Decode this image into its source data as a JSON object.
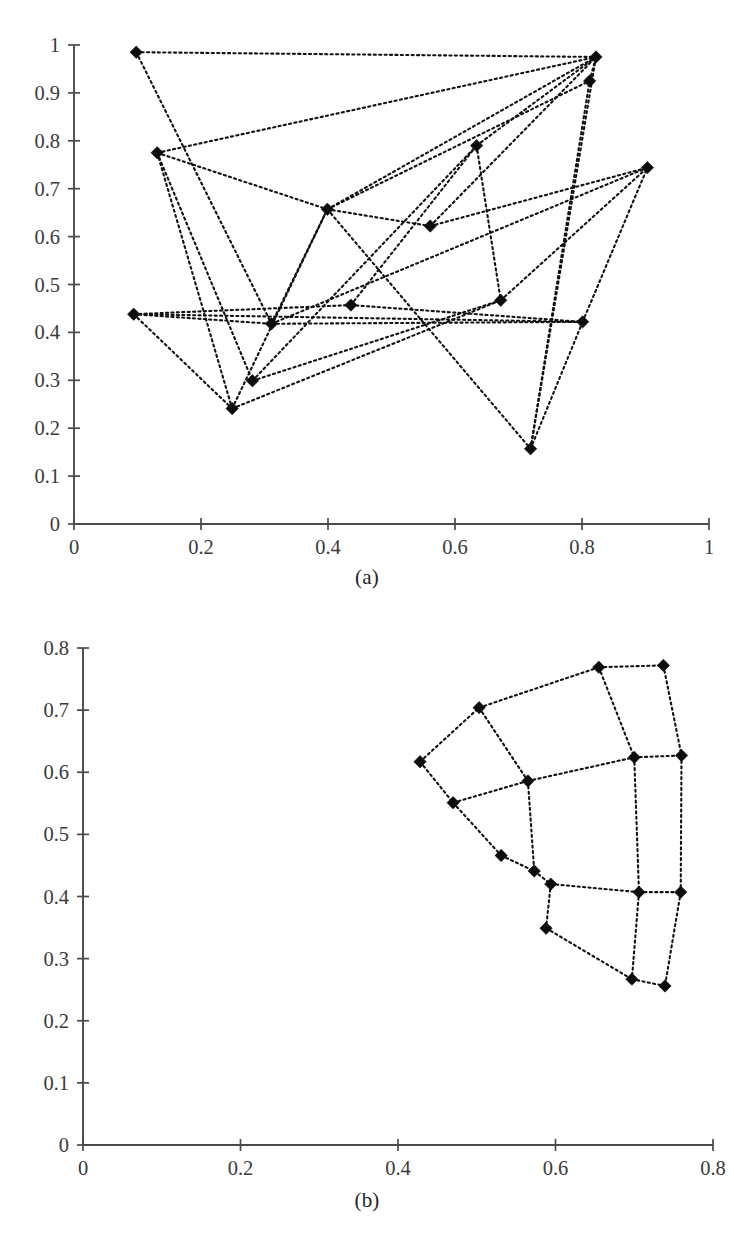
{
  "figure": {
    "panels": [
      {
        "caption": "(a)"
      },
      {
        "caption": "(b)"
      }
    ]
  },
  "chart_data": [
    {
      "type": "scatter",
      "panel": "(a)",
      "title": "",
      "subtitle": "",
      "xlabel": "",
      "ylabel": "",
      "xlim": [
        0,
        1
      ],
      "ylim": [
        0,
        1
      ],
      "xticks": [
        0,
        0.2,
        0.4,
        0.6,
        0.8,
        1
      ],
      "yticks": [
        0,
        0.1,
        0.2,
        0.3,
        0.4,
        0.5,
        0.6,
        0.7,
        0.8,
        0.9,
        1
      ],
      "xticklabels": [
        "0",
        "0.2",
        "0.4",
        "0.6",
        "0.8",
        "1"
      ],
      "yticklabels": [
        "0",
        "0.1",
        "0.2",
        "0.3",
        "0.4",
        "0.5",
        "0.6",
        "0.7",
        "0.8",
        "0.9",
        "1"
      ],
      "grid": false,
      "legend": null,
      "marker": "filled-diamond",
      "linestyle": "dotted",
      "color": "#0d0d0d",
      "description": "Randomly initialized graph layout: 16 nodes connected by dotted edges, heavily crossing.",
      "nodes": [
        {
          "id": 0,
          "x": 0.098,
          "y": 0.985
        },
        {
          "id": 1,
          "x": 0.131,
          "y": 0.775
        },
        {
          "id": 2,
          "x": 0.094,
          "y": 0.438
        },
        {
          "id": 3,
          "x": 0.249,
          "y": 0.241
        },
        {
          "id": 4,
          "x": 0.281,
          "y": 0.299
        },
        {
          "id": 5,
          "x": 0.311,
          "y": 0.418
        },
        {
          "id": 6,
          "x": 0.399,
          "y": 0.657
        },
        {
          "id": 7,
          "x": 0.436,
          "y": 0.457
        },
        {
          "id": 8,
          "x": 0.561,
          "y": 0.622
        },
        {
          "id": 9,
          "x": 0.634,
          "y": 0.79
        },
        {
          "id": 10,
          "x": 0.672,
          "y": 0.467
        },
        {
          "id": 11,
          "x": 0.719,
          "y": 0.157
        },
        {
          "id": 12,
          "x": 0.801,
          "y": 0.422
        },
        {
          "id": 13,
          "x": 0.812,
          "y": 0.925
        },
        {
          "id": 14,
          "x": 0.822,
          "y": 0.975
        },
        {
          "id": 15,
          "x": 0.903,
          "y": 0.744
        }
      ],
      "edges": [
        [
          0,
          5
        ],
        [
          0,
          14
        ],
        [
          1,
          14
        ],
        [
          1,
          4
        ],
        [
          1,
          3
        ],
        [
          1,
          6
        ],
        [
          2,
          5
        ],
        [
          2,
          12
        ],
        [
          2,
          3
        ],
        [
          2,
          7
        ],
        [
          3,
          10
        ],
        [
          3,
          6
        ],
        [
          4,
          10
        ],
        [
          4,
          9
        ],
        [
          5,
          6
        ],
        [
          5,
          15
        ],
        [
          5,
          12
        ],
        [
          6,
          14
        ],
        [
          6,
          13
        ],
        [
          6,
          11
        ],
        [
          6,
          8
        ],
        [
          7,
          12
        ],
        [
          7,
          9
        ],
        [
          8,
          14
        ],
        [
          8,
          15
        ],
        [
          9,
          14
        ],
        [
          9,
          10
        ],
        [
          10,
          15
        ],
        [
          11,
          13
        ],
        [
          11,
          14
        ],
        [
          11,
          12
        ],
        [
          12,
          15
        ],
        [
          13,
          14
        ]
      ]
    },
    {
      "type": "scatter",
      "panel": "(b)",
      "title": "",
      "subtitle": "",
      "xlabel": "",
      "ylabel": "",
      "xlim": [
        0,
        0.8
      ],
      "ylim": [
        0,
        0.8
      ],
      "xticks": [
        0,
        0.2,
        0.4,
        0.6,
        0.8
      ],
      "yticks": [
        0,
        0.1,
        0.2,
        0.3,
        0.4,
        0.5,
        0.6,
        0.7,
        0.8
      ],
      "xticklabels": [
        "0",
        "0.2",
        "0.4",
        "0.6",
        "0.8"
      ],
      "yticklabels": [
        "0",
        "0.1",
        "0.2",
        "0.3",
        "0.4",
        "0.5",
        "0.6",
        "0.7",
        "0.8"
      ],
      "grid": false,
      "legend": null,
      "marker": "filled-diamond",
      "linestyle": "dotted",
      "color": "#0d0d0d",
      "description": "Converged / untangled layout of the same 16-node graph, forming a regular 4x4 quadrilateral mesh in the upper-right region.",
      "nodes": [
        {
          "id": 0,
          "x": 0.428,
          "y": 0.617
        },
        {
          "id": 1,
          "x": 0.503,
          "y": 0.704
        },
        {
          "id": 2,
          "x": 0.655,
          "y": 0.769
        },
        {
          "id": 3,
          "x": 0.737,
          "y": 0.772
        },
        {
          "id": 4,
          "x": 0.47,
          "y": 0.551
        },
        {
          "id": 5,
          "x": 0.565,
          "y": 0.586
        },
        {
          "id": 6,
          "x": 0.7,
          "y": 0.624
        },
        {
          "id": 7,
          "x": 0.76,
          "y": 0.627
        },
        {
          "id": 8,
          "x": 0.531,
          "y": 0.466
        },
        {
          "id": 9,
          "x": 0.573,
          "y": 0.441
        },
        {
          "id": 10,
          "x": 0.594,
          "y": 0.42
        },
        {
          "id": 11,
          "x": 0.706,
          "y": 0.407
        },
        {
          "id": 12,
          "x": 0.759,
          "y": 0.407
        },
        {
          "id": 13,
          "x": 0.588,
          "y": 0.349
        },
        {
          "id": 14,
          "x": 0.697,
          "y": 0.267
        },
        {
          "id": 15,
          "x": 0.739,
          "y": 0.256
        }
      ],
      "edges": [
        [
          0,
          1
        ],
        [
          1,
          2
        ],
        [
          2,
          3
        ],
        [
          4,
          5
        ],
        [
          5,
          6
        ],
        [
          6,
          7
        ],
        [
          10,
          11
        ],
        [
          11,
          12
        ],
        [
          13,
          14
        ],
        [
          14,
          15
        ],
        [
          0,
          4
        ],
        [
          4,
          8
        ],
        [
          8,
          9
        ],
        [
          1,
          5
        ],
        [
          5,
          9
        ],
        [
          9,
          10
        ],
        [
          10,
          13
        ],
        [
          2,
          6
        ],
        [
          6,
          11
        ],
        [
          11,
          14
        ],
        [
          3,
          7
        ],
        [
          7,
          12
        ],
        [
          12,
          15
        ]
      ]
    }
  ]
}
